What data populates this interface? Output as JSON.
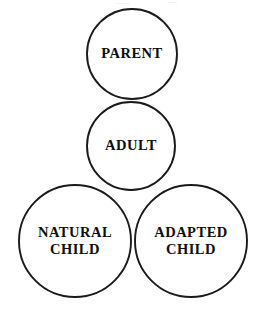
{
  "diagram": {
    "type": "venn-like-circle-cluster",
    "title": "",
    "background_color": "#ffffff",
    "stroke_color": "#1a1a1a",
    "text_color": "#0d0d0d",
    "circles": [
      {
        "id": "parent",
        "label": "PARENT",
        "cx": 132,
        "cy": 54,
        "r": 45,
        "fill": "#ffffff",
        "stroke": "#1a1a1a"
      },
      {
        "id": "adult",
        "label": "ADULT",
        "cx": 131,
        "cy": 146,
        "r": 44,
        "fill": "#ffffff",
        "stroke": "#1a1a1a"
      },
      {
        "id": "natural-child",
        "label": "NATURAL\nCHILD",
        "cx": 75,
        "cy": 241,
        "r": 56,
        "fill": "#ffffff",
        "stroke": "#1a1a1a"
      },
      {
        "id": "adapted-child",
        "label": "ADAPTED\nCHILD",
        "cx": 191,
        "cy": 241,
        "r": 56,
        "fill": "#ffffff",
        "stroke": "#1a1a1a"
      }
    ]
  }
}
